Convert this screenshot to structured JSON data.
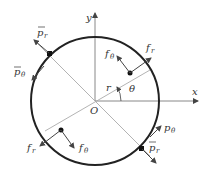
{
  "diagram": {
    "type": "polar-coordinate force diagram",
    "axes": {
      "x_label": "x",
      "y_label": "y",
      "origin_label": "O"
    },
    "radius_label": "r",
    "angle_label": "θ",
    "labels": {
      "pr_bar_top": {
        "base": "p",
        "sub": "r",
        "bar": true
      },
      "ptheta_bar_top": {
        "base": "p",
        "sub": "θ",
        "bar": true
      },
      "fr_upper": {
        "base": "f",
        "sub": "r"
      },
      "ftheta_upper": {
        "base": "f",
        "sub": "θ"
      },
      "fr_lower": {
        "base": "f",
        "sub": "r"
      },
      "ftheta_lower": {
        "base": "f",
        "sub": "θ"
      },
      "ptheta_right": {
        "base": "p",
        "sub": "θ"
      },
      "pr_bar_bottom": {
        "base": "p",
        "sub": "r",
        "bar": true
      }
    },
    "colors": {
      "circle": "#222222",
      "lines": "#999999",
      "arrows": "#444444"
    }
  }
}
